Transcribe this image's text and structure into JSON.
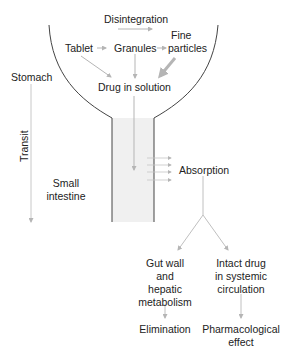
{
  "diagram": {
    "labels": {
      "disintegration": "Disintegration",
      "tablet": "Tablet",
      "granules": "Granules",
      "fine_particles_line1": "Fine",
      "fine_particles_line2": "particles",
      "drug_in_solution": "Drug in solution",
      "stomach": "Stomach",
      "transit": "Transit",
      "small_intestine_line1": "Small",
      "small_intestine_line2": "intestine",
      "absorption": "Absorption",
      "gut_wall_line1": "Gut wall",
      "gut_wall_line2": "and",
      "gut_wall_line3": "hepatic",
      "gut_wall_line4": "metabolism",
      "intact_drug_line1": "Intact drug",
      "intact_drug_line2": "in systemic",
      "intact_drug_line3": "circulation",
      "elimination": "Elimination",
      "pharmacological_line1": "Pharmacological",
      "pharmacological_line2": "effect"
    },
    "colors": {
      "outline": "#444444",
      "arrow": "#b5b5b5",
      "tube_fill": "#f0f0f0",
      "text": "#222222"
    }
  }
}
